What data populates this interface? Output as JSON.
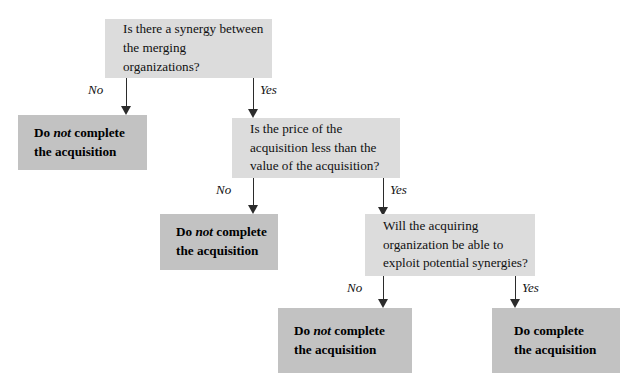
{
  "diagram": {
    "colors": {
      "decision_fill": "#dcdcdc",
      "outcome_fill": "#c2c2c2",
      "line": "#2b2b2b",
      "background": "#ffffff",
      "text": "#101010"
    },
    "nodes": [
      {
        "id": "d1",
        "kind": "decision",
        "line1": "Is there a synergy between",
        "line2": "the merging organizations?",
        "text": "Is there a synergy between\nthe merging organizations?"
      },
      {
        "id": "o1",
        "kind": "outcome",
        "prefix": "Do ",
        "emphasis": "not",
        "suffix": " complete",
        "line2": "the acquisition",
        "text": "Do not complete the acquisition"
      },
      {
        "id": "d2",
        "kind": "decision",
        "line1": "Is the price of the",
        "line2": "acquisition less than the",
        "line3": "value of the acquisition?",
        "text": "Is the price of the\nacquisition less than the\nvalue of the acquisition?"
      },
      {
        "id": "o2",
        "kind": "outcome",
        "prefix": "Do ",
        "emphasis": "not",
        "suffix": " complete",
        "line2": "the acquisition",
        "text": "Do not complete the acquisition"
      },
      {
        "id": "d3",
        "kind": "decision",
        "line1": "Will the acquiring",
        "line2": "organization be able to",
        "line3": "exploit potential synergies?",
        "text": "Will the acquiring\norganization be able to\nexploit potential synergies?"
      },
      {
        "id": "o3",
        "kind": "outcome",
        "prefix": "Do ",
        "emphasis": "not",
        "suffix": " complete",
        "line2": "the acquisition",
        "text": "Do not complete the acquisition"
      },
      {
        "id": "o4",
        "kind": "outcome",
        "prefix": "Do  ",
        "emphasis": "",
        "suffix": "complete",
        "line2": "the acquisition",
        "text": "Do  complete the acquisition"
      }
    ],
    "edges": [
      {
        "id": "e1",
        "from": "d1",
        "to": "o1",
        "label": "No"
      },
      {
        "id": "e2",
        "from": "d1",
        "to": "d2",
        "label": "Yes"
      },
      {
        "id": "e3",
        "from": "d2",
        "to": "o2",
        "label": "No"
      },
      {
        "id": "e4",
        "from": "d2",
        "to": "d3",
        "label": "Yes"
      },
      {
        "id": "e5",
        "from": "d3",
        "to": "o3",
        "label": "No"
      },
      {
        "id": "e6",
        "from": "d3",
        "to": "o4",
        "label": "Yes"
      }
    ]
  }
}
